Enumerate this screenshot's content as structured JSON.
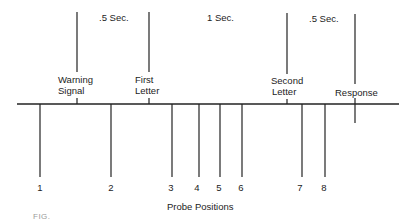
{
  "diagram": {
    "baseline": {
      "x1": 17,
      "x2": 399,
      "y": 104
    },
    "events": [
      {
        "label_line1": "Warning",
        "label_line2": "Signal",
        "x": 77
      },
      {
        "label_line1": "First",
        "label_line2": "Letter",
        "x": 149
      },
      {
        "label_line1": "Second",
        "label_line2": "Letter",
        "x": 287
      },
      {
        "label_line1": "Response",
        "label_line2": "",
        "x": 355
      }
    ],
    "intervals": [
      {
        "label": ".5 Sec.",
        "x": 100
      },
      {
        "label": "1 Sec.",
        "x": 208
      },
      {
        "label": ".5 Sec.",
        "x": 310
      }
    ],
    "probes": [
      {
        "label": "1",
        "x": 40
      },
      {
        "label": "2",
        "x": 111
      },
      {
        "label": "3",
        "x": 172
      },
      {
        "label": "4",
        "x": 199
      },
      {
        "label": "5",
        "x": 220
      },
      {
        "label": "6",
        "x": 242
      },
      {
        "label": "7",
        "x": 302
      },
      {
        "label": "8",
        "x": 325
      }
    ],
    "probe_axis_label": "Probe Positions",
    "caption_fragment": "FIG."
  }
}
